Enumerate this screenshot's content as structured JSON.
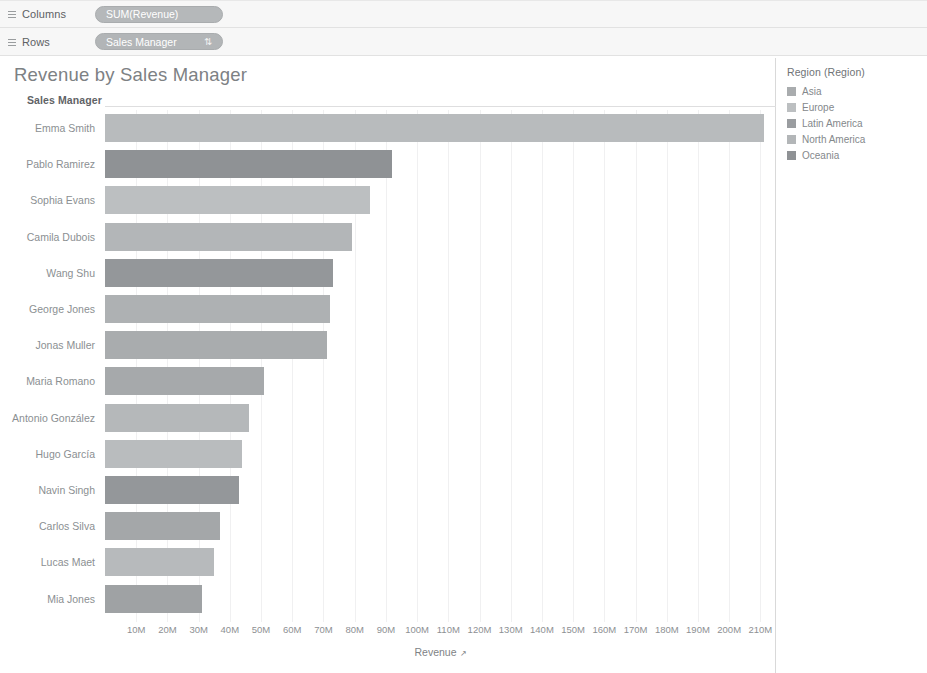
{
  "shelves": {
    "columns": {
      "label": "Columns",
      "icon": "grid-icon",
      "pill": "SUM(Revenue)"
    },
    "rows": {
      "label": "Rows",
      "icon": "grid-icon",
      "pill": "Sales Manager",
      "sort_glyph": "⇅"
    }
  },
  "worksheet": {
    "title": "Revenue by Sales Manager",
    "row_field_header": "Sales Manager",
    "axis_title": "Revenue",
    "axis_sort_glyph": "↗"
  },
  "legend": {
    "title": "Region (Region)",
    "items": [
      {
        "label": "Asia",
        "color": "#a9acae"
      },
      {
        "label": "Europe",
        "color": "#bcbfc1"
      },
      {
        "label": "Latin America",
        "color": "#9a9da0"
      },
      {
        "label": "North America",
        "color": "#b3b6b8"
      },
      {
        "label": "Oceania",
        "color": "#8f9295"
      }
    ]
  },
  "chart_data": {
    "type": "bar",
    "orientation": "horizontal",
    "title": "Revenue by Sales Manager",
    "xlabel": "Revenue",
    "ylabel": "Sales Manager",
    "xlim": [
      0,
      215
    ],
    "units": "M",
    "grid": true,
    "legend_position": "right",
    "color_field": "Region (Region)",
    "tick_labels": [
      "10M",
      "20M",
      "30M",
      "40M",
      "50M",
      "60M",
      "70M",
      "80M",
      "90M",
      "100M",
      "110M",
      "120M",
      "130M",
      "140M",
      "150M",
      "160M",
      "170M",
      "180M",
      "190M",
      "200M",
      "210M"
    ],
    "tick_values": [
      10,
      20,
      30,
      40,
      50,
      60,
      70,
      80,
      90,
      100,
      110,
      120,
      130,
      140,
      150,
      160,
      170,
      180,
      190,
      200,
      210
    ],
    "categories": [
      "Emma Smith",
      "Pablo Ramirez",
      "Sophia Evans",
      "Camila Dubois",
      "Wang Shu",
      "George Jones",
      "Jonas Muller",
      "Maria Romano",
      "Antonio González",
      "Hugo García",
      "Navin Singh",
      "Carlos Silva",
      "Lucas Maet",
      "Mia Jones"
    ],
    "values": [
      211,
      92,
      85,
      79,
      73,
      72,
      71,
      51,
      46,
      44,
      43,
      37,
      35,
      31
    ],
    "bar_regions": [
      "North America",
      "Oceania",
      "Europe",
      "North America",
      "Oceania",
      "North America",
      "Asia",
      "Asia",
      "North America",
      "Europe",
      "Oceania",
      "Asia",
      "North America",
      "Asia"
    ],
    "bar_colors": [
      "#b8bbbd",
      "#8f9295",
      "#bcbfc1",
      "#b3b6b8",
      "#94979a",
      "#aeb1b3",
      "#a9acae",
      "#a6a9ab",
      "#b5b8ba",
      "#b9bcbe",
      "#94979a",
      "#a4a7a9",
      "#b7babc",
      "#9fa2a4"
    ]
  }
}
